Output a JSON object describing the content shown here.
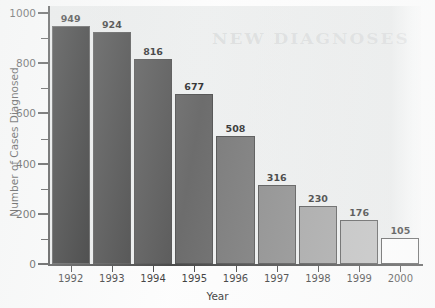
{
  "chart_data": {
    "type": "bar",
    "title": "",
    "xlabel": "Year",
    "ylabel": "Number of Cases Diagnosed",
    "categories": [
      "1992",
      "1993",
      "1994",
      "1995",
      "1996",
      "1997",
      "1998",
      "1999",
      "2000"
    ],
    "values": [
      949,
      924,
      816,
      677,
      508,
      316,
      230,
      176,
      105
    ],
    "value_labels": [
      "949",
      "924",
      "816",
      "677",
      "508",
      "316",
      "230",
      "176",
      "105"
    ],
    "ylim": [
      0,
      1000
    ],
    "xlim_note": "categorical",
    "y_major_ticks": [
      0,
      200,
      400,
      600,
      800,
      1000
    ],
    "y_major_tick_labels": [
      "0",
      "200",
      "400",
      "600",
      "800",
      "1000"
    ],
    "y_minor_ticks": [
      100,
      300,
      500,
      700,
      900
    ],
    "grid": false,
    "legend": "none",
    "bar_colors": [
      "#0b0b0b",
      "#2b2b2b",
      "#414141",
      "#545454",
      "#666666",
      "#7b7b7b",
      "#969696",
      "#b4b4b4",
      "#ffffff"
    ],
    "bar_edge_color": "#3a3a3a",
    "plot_background": "#e9ebeb",
    "text_color": "#141414",
    "annotation_note": "Value printed above each bar"
  },
  "artifacts": {
    "bleed_through_text": "NEW DIAGNOSES"
  }
}
